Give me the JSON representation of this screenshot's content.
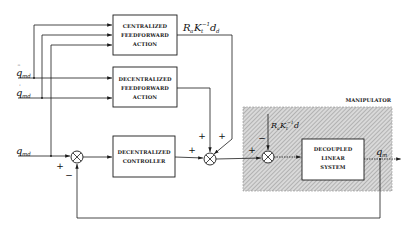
{
  "diagram": {
    "blocks": {
      "centralized_ff": [
        "CENTRALIZED",
        "FEEDFORWARD",
        "ACTION"
      ],
      "decentralized_ff": [
        "DECENTRALIZED",
        "FEEDFORWARD",
        "ACTION"
      ],
      "decentralized_controller": [
        "DECENTRALIZED",
        "CONTROLLER"
      ],
      "decoupled_system": [
        "DECOUPLED",
        "LINEAR",
        "SYSTEM"
      ]
    },
    "region_label": "MANIPULATOR",
    "inputs": {
      "acc": {
        "base": "q",
        "accent": "¨",
        "sub": "md"
      },
      "vel": {
        "base": "q",
        "accent": "˙",
        "sub": "md"
      },
      "pos": {
        "base": "q",
        "sub": "md"
      }
    },
    "output": {
      "base": "q",
      "sub": "m"
    },
    "signals": {
      "centralized_out": {
        "text1": "R",
        "sub1": "a",
        "text2": "K",
        "sub2": "t",
        "sup": "−1",
        "text3": "d",
        "sub3": "d"
      },
      "disturbance": {
        "text1": "R",
        "sub1": "a",
        "text2": "K",
        "sub2": "t",
        "sup": "−1",
        "text3": "d"
      }
    },
    "signs": {
      "sum1_ref": "+",
      "sum1_fb": "−",
      "sum2_ctrl": "+",
      "sum2_ff1": "+",
      "sum2_ff2": "+",
      "sum3_in": "+",
      "sum3_dist": "−"
    },
    "colors": {
      "line": "#1a1a1a",
      "hatch_bg": "#d8d8d8",
      "hatch_line": "#8a8a8a"
    }
  }
}
